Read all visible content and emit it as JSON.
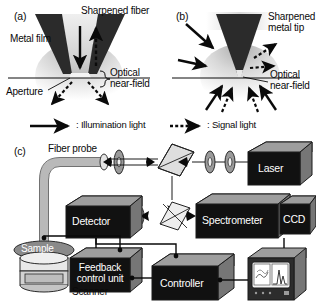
{
  "figure": {
    "type": "scientific-diagram",
    "background_color": "#ffffff",
    "ink_color": "#0a0a0a"
  },
  "panel_a": {
    "id": "(a)",
    "labels": {
      "probe": "Sharpened fiber",
      "coating": "Metal film",
      "aperture": "Aperture",
      "near_field": "Optical\nnear-field"
    },
    "arrows": [
      {
        "name": "illumination-down",
        "style": "solid",
        "direction": "down"
      },
      {
        "name": "signal-up",
        "style": "dotted",
        "direction": "up"
      },
      {
        "name": "signal-scatter-left",
        "style": "dotted",
        "direction": "down-left"
      },
      {
        "name": "signal-scatter-right",
        "style": "dotted",
        "direction": "down-right"
      }
    ]
  },
  "panel_b": {
    "id": "(b)",
    "labels": {
      "probe": "Sharpened\nmetal tip",
      "near_field": "Optical\nnear-field"
    },
    "arrows": [
      {
        "name": "illumination-upper-left",
        "style": "solid",
        "direction": "down-right"
      },
      {
        "name": "illumination-mid-left",
        "style": "solid",
        "direction": "right"
      },
      {
        "name": "signal-upper-right-diagonal",
        "style": "dotted",
        "direction": "up-right"
      },
      {
        "name": "signal-mid-right",
        "style": "dotted",
        "direction": "right"
      },
      {
        "name": "illumination-lower-left",
        "style": "solid",
        "direction": "up-right"
      },
      {
        "name": "signal-lower-left",
        "style": "dotted",
        "direction": "up-right"
      },
      {
        "name": "signal-lower-right",
        "style": "dotted",
        "direction": "up-left"
      },
      {
        "name": "illumination-lower-far-right",
        "style": "solid",
        "direction": "up-left"
      }
    ]
  },
  "legend": {
    "items": [
      {
        "symbol": "solid-arrow",
        "label": ": Illumination light"
      },
      {
        "symbol": "dotted-arrow",
        "label": ": Signal light"
      }
    ]
  },
  "panel_c": {
    "id": "(c)",
    "labels": {
      "fiber_probe": "Fiber probe",
      "sample": "Sample",
      "scanner": "Scanner"
    },
    "instruments": [
      {
        "name": "laser",
        "label": "Laser"
      },
      {
        "name": "detector",
        "label": "Detector"
      },
      {
        "name": "spectrometer",
        "label": "Spectrometer"
      },
      {
        "name": "ccd",
        "label": "CCD"
      },
      {
        "name": "feedback-control-unit",
        "label": "Feedback\ncontrol unit"
      },
      {
        "name": "controller",
        "label": "Controller"
      }
    ],
    "optics": [
      {
        "name": "lens-probe-coupling"
      },
      {
        "name": "beam-splitter-upper"
      },
      {
        "name": "lens-laser-1"
      },
      {
        "name": "lens-laser-2"
      },
      {
        "name": "beam-splitter-lower"
      },
      {
        "name": "lens-detector"
      }
    ],
    "monitor": {
      "name": "display-monitor",
      "left_panel": "near-field image map",
      "right_panel": "spectrum with peaks"
    }
  }
}
